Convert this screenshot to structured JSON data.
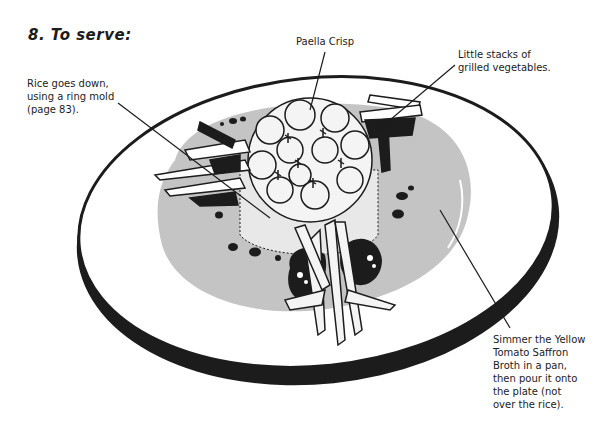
{
  "page": {
    "step_title": "8. To serve:",
    "annotations": {
      "rice_mold": "Rice goes down,\nusing a ring mold\n(page 83).",
      "paella_crisp": "Paella Crisp",
      "grilled_vegetables": "Little stacks of\ngrilled vegetables.",
      "broth": "Simmer the Yellow\nTomato Saffron\nBroth in a pan,\nthen pour it onto\nthe plate (not\nover the rice)."
    },
    "illustration": {
      "subject": "plated paella dish",
      "colors": {
        "ink": "#1c1c1c",
        "broth_gray": "#c4c4c4",
        "plate_white": "#ffffff",
        "rice_light": "#e8e8e8"
      }
    }
  }
}
